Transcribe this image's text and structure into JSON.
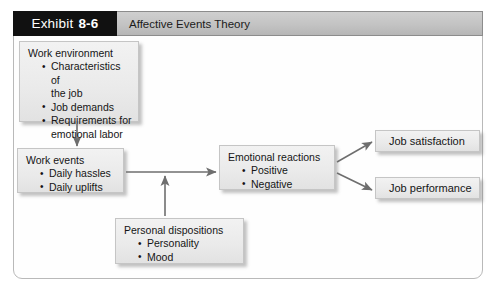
{
  "header": {
    "exhibit_label": "Exhibit",
    "exhibit_number": "8-6",
    "title": "Affective Events Theory"
  },
  "diagram": {
    "type": "flowchart",
    "nodes": [
      {
        "id": "work-environment",
        "title": "Work environment",
        "items": [
          "Characteristics of",
          "the job",
          "Job demands",
          "Requirements for",
          "emotional labor"
        ],
        "bullets": [
          {
            "text": "Characteristics of",
            "continuation": "the job"
          },
          {
            "text": "Job demands",
            "continuation": ""
          },
          {
            "text": "Requirements for",
            "continuation": "emotional labor"
          }
        ]
      },
      {
        "id": "work-events",
        "title": "Work events",
        "bullets": [
          {
            "text": "Daily hassles",
            "continuation": ""
          },
          {
            "text": "Daily uplifts",
            "continuation": ""
          }
        ]
      },
      {
        "id": "personal-dispositions",
        "title": "Personal dispositions",
        "bullets": [
          {
            "text": "Personality",
            "continuation": ""
          },
          {
            "text": "Mood",
            "continuation": ""
          }
        ]
      },
      {
        "id": "emotional-reactions",
        "title": "Emotional reactions",
        "bullets": [
          {
            "text": "Positive",
            "continuation": ""
          },
          {
            "text": "Negative",
            "continuation": ""
          }
        ]
      },
      {
        "id": "job-satisfaction",
        "title": "Job satisfaction",
        "bullets": []
      },
      {
        "id": "job-performance",
        "title": "Job performance",
        "bullets": []
      }
    ],
    "edges": [
      {
        "from": "work-environment",
        "to": "work-events",
        "direction": "down"
      },
      {
        "from": "work-events",
        "to": "emotional-reactions",
        "direction": "right"
      },
      {
        "from": "personal-dispositions",
        "to": "work-events-to-emotional-reactions-link",
        "direction": "up"
      },
      {
        "from": "emotional-reactions",
        "to": "job-satisfaction",
        "direction": "up-right"
      },
      {
        "from": "emotional-reactions",
        "to": "job-performance",
        "direction": "down-right"
      }
    ]
  },
  "colors": {
    "exhibit_box_bg": "#111111",
    "exhibit_box_fg": "#ffffff",
    "title_bar_bg": "#c3c3c3",
    "node_bg": "#eaeaea",
    "node_border": "#c5c5c5",
    "arrow": "#6e6e6e",
    "frame_border": "#b9b9b9",
    "page_bg": "#ffffff"
  }
}
